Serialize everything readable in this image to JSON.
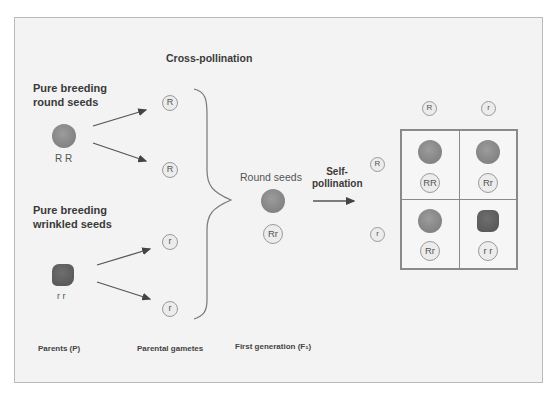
{
  "diagram": {
    "title": "Cross-pollination",
    "parents": {
      "round": {
        "label_line1": "Pure breeding",
        "label_line2": "round seeds",
        "genotype": "R R",
        "shape": "round"
      },
      "wrinkled": {
        "label_line1": "Pure breeding",
        "label_line2": "wrinkled seeds",
        "genotype": "r r",
        "shape": "wrinkled"
      }
    },
    "gametes": [
      "R",
      "R",
      "r",
      "r"
    ],
    "f1": {
      "label": "Round seeds",
      "genotype": "Rr",
      "shape": "round"
    },
    "self_pollination": {
      "line1": "Self-",
      "line2": "pollination"
    },
    "punnett": {
      "column_headers": [
        "R",
        "r"
      ],
      "row_headers": [
        "R",
        "r"
      ],
      "cells": [
        {
          "genotype": "RR",
          "shape": "round"
        },
        {
          "genotype": "Rr",
          "shape": "round"
        },
        {
          "genotype": "Rr",
          "shape": "round"
        },
        {
          "genotype": "r r",
          "shape": "wrinkled"
        }
      ]
    },
    "footer_labels": {
      "parents": "Parents (P)",
      "gametes": "Parental gametes",
      "first_generation": "First generation (F₁)"
    },
    "colors": {
      "background": "#f3f3f3",
      "frame_border": "#b9b9b9",
      "round_seed": "#8a8a8a",
      "wrinkled_seed": "#5e5e5e",
      "lines": "#555555"
    }
  }
}
